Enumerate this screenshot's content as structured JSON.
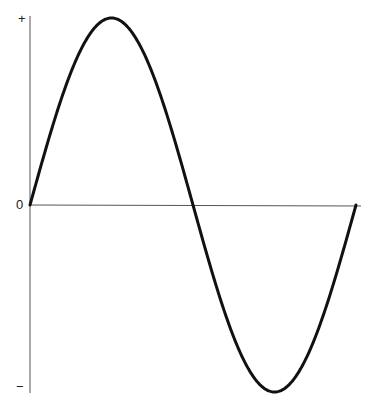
{
  "chart_data": {
    "type": "line",
    "title": "",
    "xlabel": "",
    "ylabel": "",
    "y_tick_labels": [
      "+",
      "0",
      "−"
    ],
    "series": [
      {
        "name": "sine wave",
        "x": [
          0,
          0.125,
          0.25,
          0.375,
          0.5,
          0.625,
          0.75,
          0.875,
          1.0
        ],
        "values": [
          0,
          0.71,
          1,
          0.71,
          0,
          -0.71,
          -1,
          -0.71,
          0
        ]
      }
    ],
    "xlim": [
      0,
      1
    ],
    "ylim": [
      -1,
      1
    ],
    "grid": false,
    "legend": null,
    "colors": {
      "line": "#111111",
      "axis": "#444444"
    }
  },
  "labels": {
    "plus": "+",
    "zero": "0",
    "minus": "−"
  }
}
